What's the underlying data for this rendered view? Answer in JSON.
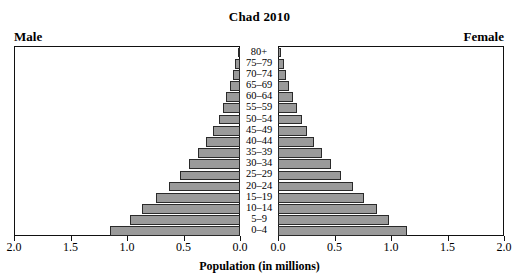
{
  "chart_data": {
    "type": "bar",
    "subtype": "population-pyramid",
    "title": "Chad 2010",
    "xlabel": "Population (in millions)",
    "ylabel": "",
    "grid": false,
    "legend_position": "top-corners",
    "axis_ticks": [
      "2.0",
      "1.5",
      "1.0",
      "0.5",
      "0.0",
      "0.0",
      "0.5",
      "1.0",
      "1.5",
      "2.0"
    ],
    "left_ticks": [
      "2.0",
      "1.5",
      "1.0",
      "0.5",
      "0.0"
    ],
    "right_ticks": [
      "0.0",
      "0.5",
      "1.0",
      "1.5",
      "2.0"
    ],
    "xlim": [
      0,
      2.0
    ],
    "panel_labels": {
      "left": "Male",
      "right": "Female"
    },
    "categories": [
      "80+",
      "75–79",
      "70–74",
      "65–69",
      "60–64",
      "55–59",
      "50–54",
      "45–49",
      "40–44",
      "35–39",
      "30–34",
      "25–29",
      "20–24",
      "15–19",
      "10–14",
      "5–9",
      "0–4"
    ],
    "series": [
      {
        "name": "Male",
        "side": "left",
        "values": [
          0.02,
          0.04,
          0.06,
          0.09,
          0.12,
          0.15,
          0.19,
          0.24,
          0.3,
          0.37,
          0.45,
          0.53,
          0.63,
          0.74,
          0.87,
          0.97,
          1.15
        ]
      },
      {
        "name": "Female",
        "side": "right",
        "values": [
          0.03,
          0.05,
          0.07,
          0.1,
          0.13,
          0.17,
          0.21,
          0.26,
          0.32,
          0.39,
          0.47,
          0.56,
          0.66,
          0.76,
          0.88,
          0.98,
          1.14
        ]
      }
    ],
    "colors": {
      "bar_fill": "#9a9a9a",
      "bar_stroke": "#2a2a2a",
      "axis": "#111111",
      "background": "#ffffff"
    }
  }
}
